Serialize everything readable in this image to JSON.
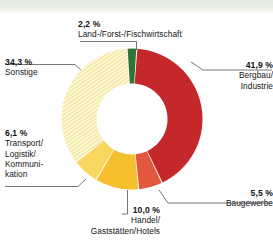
{
  "figure": {
    "type": "donut-pie-chart",
    "background_color": "#ffffff",
    "top_band_color": "#e5ecdf"
  },
  "chart_data": {
    "type": "pie",
    "variant": "donut",
    "title": "",
    "subtitle": "",
    "xlabel": "",
    "ylabel": "",
    "units": "%",
    "decimal_separator": ",",
    "total": 100.0,
    "legend_position": "callout-labels",
    "grid": false,
    "start_angle_deg": -4,
    "direction": "clockwise",
    "categories": [
      "Land-/Forst-/Fischwirtschaft",
      "Bergbau/Industrie",
      "Baugewerbe",
      "Handel/Gaststätten/Hotels",
      "Transport/Logistik/Kommunikation",
      "Sonstige"
    ],
    "values": [
      2.2,
      41.9,
      5.5,
      10.0,
      6.1,
      34.3
    ],
    "value_labels": [
      "2,2 %",
      "41,9 %",
      "5,5 %",
      "10,0 %",
      "6,1 %",
      "34,3 %"
    ],
    "colors": [
      "#2f7337",
      "#c4282a",
      "#e4573f",
      "#f5bf2e",
      "#f8d761",
      "#f4eda2"
    ],
    "slice_patterns": [
      "solid",
      "solid",
      "solid",
      "solid",
      "solid",
      "diagonal-hatch"
    ],
    "slices": [
      {
        "key": "agriculture",
        "percent_label": "2,2 %",
        "name": "Land-/Forst-/Fischwirtschaft",
        "value": 2.2,
        "color": "#2f7337",
        "pattern": "solid"
      },
      {
        "key": "mining",
        "percent_label": "41,9 %",
        "name_line1": "Bergbau/",
        "name_line2": "Industrie",
        "value": 41.9,
        "color": "#c4282a",
        "pattern": "solid"
      },
      {
        "key": "construction",
        "percent_label": "5,5 %",
        "name": "Baugewerbe",
        "value": 5.5,
        "color": "#e4573f",
        "pattern": "solid"
      },
      {
        "key": "trade",
        "percent_label": "10,0 %",
        "name_line1": "Handel/",
        "name_line2": "Gaststätten/Hotels",
        "value": 10.0,
        "color": "#f5bf2e",
        "pattern": "solid"
      },
      {
        "key": "transport",
        "percent_label": "6,1 %",
        "name_line1": "Transport/",
        "name_line2": "Logistik/",
        "name_line3": "Kommuni-",
        "name_line4": "kation",
        "value": 6.1,
        "color": "#f8d761",
        "pattern": "solid"
      },
      {
        "key": "other",
        "percent_label": "34,3 %",
        "name": "Sonstige",
        "value": 34.3,
        "color": "#f4eda2",
        "pattern": "diagonal-hatch"
      }
    ]
  }
}
